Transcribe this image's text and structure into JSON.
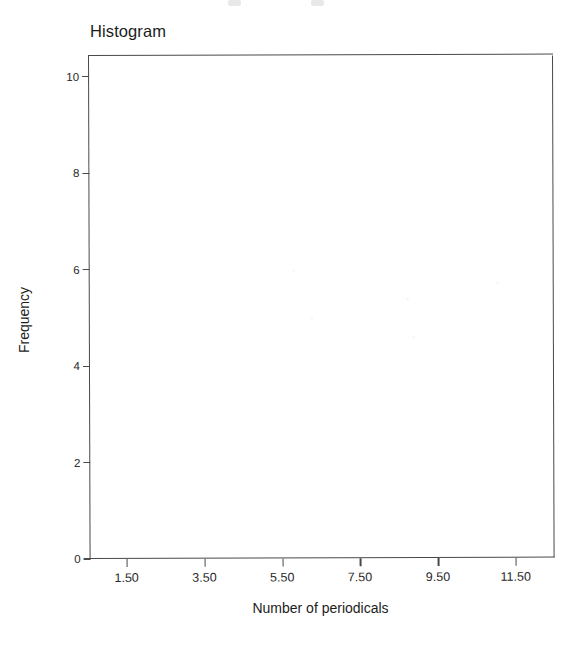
{
  "figure": {
    "background_color": "#ffffff",
    "frame_color": "#4a4a4a",
    "text_color": "#1c1c1c"
  },
  "chart_data": {
    "type": "bar",
    "title": "Histogram",
    "xlabel": "Number of periodicals",
    "ylabel": "Frequency",
    "xlim": [
      0.55,
      12.5
    ],
    "ylim": [
      0,
      10.45
    ],
    "grid": false,
    "legend": null,
    "x_tick_labels": [
      "1.50",
      "3.50",
      "5.50",
      "7.50",
      "9.50",
      "11.50"
    ],
    "x_tick_values": [
      1.5,
      3.5,
      5.5,
      7.5,
      9.5,
      11.5
    ],
    "y_tick_labels": [
      "0",
      "2",
      "4",
      "6",
      "8",
      "10"
    ],
    "y_tick_values": [
      0,
      2,
      4,
      6,
      8,
      10
    ],
    "categories": [],
    "values": [],
    "annotations": [],
    "note": "Plot area is blank — no bars rendered in this scanned figure."
  }
}
